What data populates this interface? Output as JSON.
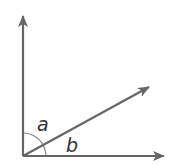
{
  "diagram": {
    "type": "angle-diagram",
    "labels": {
      "angle_a": "a",
      "angle_b": "b"
    },
    "colors": {
      "stroke": "#666666",
      "arc": "#888888",
      "text": "#333333",
      "background": "#ffffff"
    },
    "rays": [
      {
        "name": "vertical-ray",
        "direction": "up"
      },
      {
        "name": "diagonal-ray",
        "direction": "up-right"
      },
      {
        "name": "horizontal-ray",
        "direction": "right"
      }
    ]
  }
}
